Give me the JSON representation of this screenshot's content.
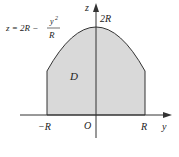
{
  "diagram": {
    "axes": {
      "horizontal_label": "y",
      "vertical_label": "z",
      "origin_label": "O"
    },
    "ticks": {
      "neg_R": "−R",
      "pos_R": "R",
      "top": "2R"
    },
    "region_label": "D",
    "curve_equation": {
      "lhs": "z = 2R −",
      "numerator": "y",
      "exponent": "2",
      "denominator": "R"
    },
    "colors": {
      "fill": "#d9d9d9",
      "stroke": "#333333",
      "axis": "#333333"
    }
  }
}
